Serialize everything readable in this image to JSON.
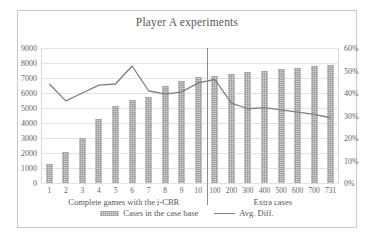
{
  "chart": {
    "title": "Player A experiments",
    "frame_border_color": "#c8c8c8",
    "bar_color": "#969696",
    "line_color": "#7f7f7f",
    "grid_color": "#e2e2e2"
  },
  "legend": {
    "items": [
      {
        "label": "Cases in the case base",
        "marker": "bar-swatch"
      },
      {
        "label": "Avg. Diff.",
        "marker": "line-swatch"
      }
    ]
  },
  "groups": [
    {
      "label": "Complete games with the i-CBR"
    },
    {
      "label": "Extra cases"
    }
  ],
  "chart_data": {
    "type": "bar",
    "title": "Player A experiments",
    "xlabel": "",
    "ylabel": "",
    "grid": true,
    "legend_position": "bottom",
    "categories": [
      "1",
      "2",
      "3",
      "4",
      "5",
      "6",
      "7",
      "8",
      "9",
      "10",
      "100",
      "200",
      "300",
      "400",
      "500",
      "600",
      "700",
      "731"
    ],
    "axes": {
      "left": {
        "label": "",
        "ylim": [
          0,
          9000
        ],
        "ticks": [
          "0",
          "1000",
          "2000",
          "3000",
          "4000",
          "5000",
          "6000",
          "7000",
          "8000",
          "9000"
        ],
        "tick_values": [
          0,
          1000,
          2000,
          3000,
          4000,
          5000,
          6000,
          7000,
          8000,
          9000
        ]
      },
      "right": {
        "label": "",
        "ylim": [
          0,
          60
        ],
        "ticks": [
          "0%",
          "10%",
          "20%",
          "30%",
          "40%",
          "50%",
          "60%"
        ],
        "tick_values": [
          0,
          10,
          20,
          30,
          40,
          50,
          60
        ]
      }
    },
    "series": [
      {
        "name": "Cases in the case base",
        "type": "bar",
        "axis": "left",
        "values": [
          1250,
          2100,
          3000,
          4300,
          5150,
          5550,
          5750,
          6450,
          6800,
          7050,
          7150,
          7300,
          7400,
          7500,
          7600,
          7700,
          7800,
          7850
        ]
      },
      {
        "name": "Avg. Diff.",
        "type": "line",
        "axis": "right",
        "unit": "%",
        "values": [
          44.0,
          36.5,
          40.0,
          43.5,
          44.0,
          52.0,
          41.0,
          39.5,
          40.5,
          44.5,
          46.0,
          35.5,
          33.0,
          33.5,
          32.5,
          31.5,
          30.5,
          29.0
        ]
      }
    ],
    "annotations": [
      {
        "type": "vertical-divider",
        "between": [
          "10",
          "100"
        ]
      },
      {
        "type": "group-label",
        "text": "Complete games with the i-CBR",
        "span": [
          "1",
          "10"
        ]
      },
      {
        "type": "group-label",
        "text": "Extra cases",
        "span": [
          "100",
          "731"
        ]
      }
    ]
  }
}
